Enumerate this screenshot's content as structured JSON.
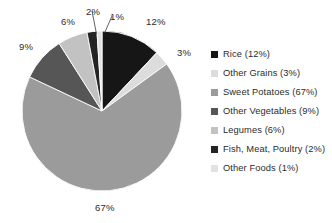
{
  "chart_data": {
    "type": "pie",
    "title": "",
    "subtitle": "",
    "xlabel": "",
    "ylabel": "",
    "grid": false,
    "legend_position": "right",
    "start_angle_deg": 0,
    "direction": "clockwise",
    "categories": [
      "Rice",
      "Other Grains",
      "Sweet Potatoes",
      "Other Vegetables",
      "Legumes",
      "Fish, Meat, Poultry",
      "Other Foods"
    ],
    "values": [
      12,
      3,
      67,
      9,
      6,
      2,
      1
    ],
    "unit": "%",
    "colors": [
      "#161616",
      "#dcdcdc",
      "#9b9b9b",
      "#565656",
      "#c2c2c2",
      "#242424",
      "#e2e2e2"
    ],
    "slice_labels": [
      "12%",
      "3%",
      "67%",
      "9%",
      "6%",
      "2%",
      "1%"
    ]
  },
  "pie": {
    "center_x": 102,
    "center_y": 111,
    "radius": 80,
    "labels": [
      {
        "text": "12%",
        "x": 146,
        "y": 17
      },
      {
        "text": "3%",
        "x": 177,
        "y": 48
      },
      {
        "text": "67%",
        "x": 95,
        "y": 203
      },
      {
        "text": "9%",
        "x": 19,
        "y": 42
      },
      {
        "text": "6%",
        "x": 61,
        "y": 17
      },
      {
        "text": "2%",
        "x": 86,
        "y": 7
      },
      {
        "text": "1%",
        "x": 110,
        "y": 12
      }
    ]
  },
  "legend": {
    "items": [
      {
        "label": "Rice (12%)",
        "color": "#161616"
      },
      {
        "label": "Other Grains (3%)",
        "color": "#dcdcdc"
      },
      {
        "label": "Sweet Potatoes (67%)",
        "color": "#9b9b9b"
      },
      {
        "label": "Other Vegetables (9%)",
        "color": "#565656"
      },
      {
        "label": "Legumes (6%)",
        "color": "#c2c2c2"
      },
      {
        "label": "Fish, Meat, Poultry (2%)",
        "color": "#242424"
      },
      {
        "label": "Other Foods (1%)",
        "color": "#e2e2e2"
      }
    ]
  }
}
